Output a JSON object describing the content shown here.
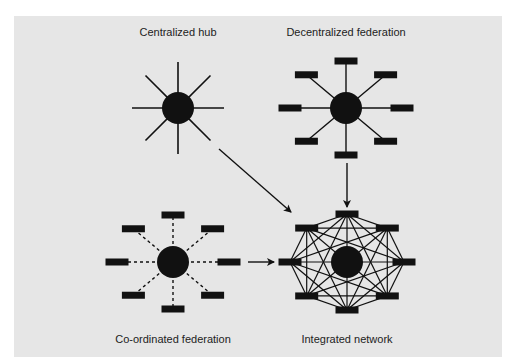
{
  "colors": {
    "panel": "#e6e6e6",
    "ink": "#111111",
    "page": "#ffffff"
  },
  "panel": {
    "x": 14,
    "y": 16,
    "width": 488,
    "height": 341
  },
  "models": [
    {
      "id": "centralized-hub",
      "label": "Centralized hub",
      "label_pos": [
        178,
        36
      ],
      "center": [
        178,
        108
      ],
      "hub_radius": 16,
      "style": "spokes",
      "spoke_length": 46
    },
    {
      "id": "decentralized-federation",
      "label": "Decentralized federation",
      "label_pos": [
        346,
        36
      ],
      "center": [
        346,
        108
      ],
      "hub_radius": 16,
      "style": "solid-nodes",
      "node_radius_x": 56,
      "node_radius_y": 47
    },
    {
      "id": "co-ordinated-federation",
      "label": "Co-ordinated federation",
      "label_pos": [
        173,
        343
      ],
      "center": [
        173,
        262
      ],
      "hub_radius": 16,
      "style": "dashed-nodes",
      "node_radius_x": 56,
      "node_radius_y": 47
    },
    {
      "id": "integrated-network",
      "label": "Integrated network",
      "label_pos": [
        347,
        343
      ],
      "center": [
        347,
        262
      ],
      "hub_radius": 16,
      "style": "mesh",
      "node_radius_x": 57,
      "node_radius_y": 48
    }
  ],
  "arrows": [
    {
      "id": "hub-to-network",
      "from": [
        219,
        149
      ],
      "to": [
        291,
        212
      ]
    },
    {
      "id": "decentralized-to-network",
      "from": [
        347,
        163
      ],
      "to": [
        347,
        207
      ]
    },
    {
      "id": "coordinated-to-network",
      "from": [
        248,
        262
      ],
      "to": [
        274,
        262
      ]
    }
  ]
}
